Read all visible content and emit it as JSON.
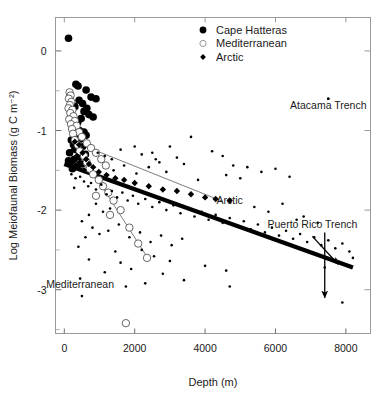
{
  "chart_data": {
    "type": "scatter",
    "title": "",
    "xlabel": "Depth (m)",
    "ylabel": "Log Meiofaunal Biomass (g C m⁻²)",
    "xlim": [
      -250,
      8700
    ],
    "ylim": [
      -3.55,
      0.42
    ],
    "xticks": [
      0,
      2000,
      4000,
      6000,
      8000
    ],
    "xtick_labels": [
      "0",
      "2000",
      "4000",
      "6000",
      "8000"
    ],
    "yticks": [
      0,
      -1,
      -2,
      -3
    ],
    "ytick_labels": [
      "0",
      "-1",
      "-2",
      "-3"
    ],
    "yminor_ticks": [
      -0.5,
      -1.5,
      -2.5,
      -3.5
    ],
    "grid": false,
    "legend_position": "top-center",
    "series": [
      {
        "name": "Cape Hatteras",
        "marker": "filled-circle",
        "marker_size": 5.2,
        "color": "#000000",
        "points": [
          [
            120,
            0.16
          ],
          [
            330,
            -0.42
          ],
          [
            390,
            -0.44
          ],
          [
            620,
            -0.49
          ],
          [
            760,
            -0.58
          ],
          [
            420,
            -0.62
          ],
          [
            520,
            -0.66
          ],
          [
            900,
            -0.6
          ],
          [
            300,
            -0.7
          ],
          [
            640,
            -0.72
          ],
          [
            560,
            -0.76
          ],
          [
            700,
            -0.8
          ],
          [
            480,
            -0.85
          ],
          [
            380,
            -0.9
          ],
          [
            820,
            -0.83
          ],
          [
            250,
            -0.95
          ],
          [
            430,
            -1.0
          ],
          [
            560,
            -1.02
          ],
          [
            330,
            -1.05
          ],
          [
            620,
            -1.06
          ],
          [
            300,
            -1.08
          ],
          [
            480,
            -1.1
          ],
          [
            200,
            -1.12
          ],
          [
            390,
            -1.14
          ],
          [
            260,
            -1.18
          ],
          [
            520,
            -1.2
          ],
          [
            340,
            -1.24
          ],
          [
            150,
            -1.28
          ],
          [
            600,
            -1.3
          ],
          [
            420,
            -1.33
          ],
          [
            280,
            -1.36
          ],
          [
            180,
            -1.4
          ],
          [
            500,
            -1.42
          ],
          [
            360,
            -1.45
          ],
          [
            230,
            -1.48
          ],
          [
            120,
            -1.38
          ]
        ]
      },
      {
        "name": "Mediterranean",
        "marker": "open-circle",
        "marker_size": 5.0,
        "color": "#555555",
        "points": [
          [
            150,
            -0.52
          ],
          [
            180,
            -0.56
          ],
          [
            130,
            -0.6
          ],
          [
            200,
            -0.64
          ],
          [
            160,
            -0.68
          ],
          [
            120,
            -0.72
          ],
          [
            230,
            -0.74
          ],
          [
            170,
            -0.78
          ],
          [
            260,
            -0.82
          ],
          [
            140,
            -0.86
          ],
          [
            300,
            -0.88
          ],
          [
            190,
            -0.92
          ],
          [
            350,
            -0.94
          ],
          [
            220,
            -0.98
          ],
          [
            420,
            -1.02
          ],
          [
            250,
            -1.04
          ],
          [
            500,
            -1.08
          ],
          [
            300,
            -1.12
          ],
          [
            640,
            -1.16
          ],
          [
            380,
            -1.18
          ],
          [
            760,
            -1.22
          ],
          [
            440,
            -1.26
          ],
          [
            900,
            -1.28
          ],
          [
            560,
            -1.32
          ],
          [
            1050,
            -1.36
          ],
          [
            640,
            -1.4
          ],
          [
            1180,
            -1.44
          ],
          [
            720,
            -1.48
          ],
          [
            820,
            -1.55
          ],
          [
            980,
            -1.62
          ],
          [
            1100,
            -1.7
          ],
          [
            1250,
            -1.78
          ],
          [
            900,
            -1.82
          ],
          [
            1400,
            -1.88
          ],
          [
            1600,
            -2.0
          ],
          [
            1300,
            -2.06
          ],
          [
            1850,
            -2.22
          ],
          [
            2100,
            -2.42
          ],
          [
            2350,
            -2.6
          ],
          [
            1750,
            -3.42
          ]
        ]
      },
      {
        "name": "Arctic",
        "marker": "filled-diamond",
        "marker_size": 3.6,
        "color": "#000000",
        "points": [
          [
            300,
            -1.14
          ],
          [
            420,
            -1.18
          ],
          [
            250,
            -1.24
          ],
          [
            520,
            -1.28
          ],
          [
            360,
            -1.32
          ],
          [
            620,
            -1.36
          ],
          [
            440,
            -1.4
          ],
          [
            700,
            -1.42
          ],
          [
            820,
            -1.46
          ],
          [
            560,
            -1.5
          ],
          [
            980,
            -1.52
          ],
          [
            1200,
            -1.56
          ],
          [
            1450,
            -1.6
          ],
          [
            1700,
            -1.62
          ],
          [
            2000,
            -1.66
          ],
          [
            2400,
            -1.7
          ],
          [
            2800,
            -1.74
          ],
          [
            3200,
            -1.76
          ],
          [
            3600,
            -1.8
          ],
          [
            4000,
            -1.84
          ],
          [
            4300,
            -1.86
          ],
          [
            4700,
            -1.88
          ]
        ]
      },
      {
        "name": "Other stations",
        "marker": "small-dot",
        "marker_size": 1.8,
        "color": "#000000",
        "points": [
          [
            200,
            -1.55
          ],
          [
            320,
            -1.6
          ],
          [
            450,
            -1.58
          ],
          [
            560,
            -1.64
          ],
          [
            680,
            -1.7
          ],
          [
            280,
            -1.72
          ],
          [
            760,
            -1.66
          ],
          [
            900,
            -1.74
          ],
          [
            1050,
            -1.68
          ],
          [
            1200,
            -1.8
          ],
          [
            1350,
            -1.76
          ],
          [
            1500,
            -1.84
          ],
          [
            1650,
            -1.78
          ],
          [
            1800,
            -1.88
          ],
          [
            1950,
            -1.82
          ],
          [
            2100,
            -1.92
          ],
          [
            2300,
            -1.86
          ],
          [
            2500,
            -1.96
          ],
          [
            2700,
            -1.9
          ],
          [
            2900,
            -2.0
          ],
          [
            3100,
            -1.94
          ],
          [
            3300,
            -2.04
          ],
          [
            3500,
            -1.98
          ],
          [
            3700,
            -2.08
          ],
          [
            3900,
            -2.02
          ],
          [
            4100,
            -2.12
          ],
          [
            4300,
            -2.06
          ],
          [
            4500,
            -2.16
          ],
          [
            4700,
            -2.1
          ],
          [
            4900,
            -2.2
          ],
          [
            5100,
            -2.14
          ],
          [
            5300,
            -2.24
          ],
          [
            5500,
            -2.18
          ],
          [
            5700,
            -2.28
          ],
          [
            5900,
            -2.22
          ],
          [
            6100,
            -2.32
          ],
          [
            6300,
            -2.26
          ],
          [
            6500,
            -2.36
          ],
          [
            6700,
            -2.3
          ],
          [
            6900,
            -2.4
          ],
          [
            7100,
            -2.34
          ],
          [
            7300,
            -2.44
          ],
          [
            7500,
            -2.38
          ],
          [
            7700,
            -2.48
          ],
          [
            7900,
            -2.42
          ],
          [
            8100,
            -2.52
          ],
          [
            3600,
            -1.08
          ],
          [
            4200,
            -1.26
          ],
          [
            4500,
            -1.32
          ],
          [
            3000,
            -1.2
          ],
          [
            2600,
            -1.36
          ],
          [
            2200,
            -1.3
          ],
          [
            5200,
            -1.46
          ],
          [
            4800,
            -1.44
          ],
          [
            5600,
            -1.52
          ],
          [
            6000,
            -1.48
          ],
          [
            3400,
            -1.42
          ],
          [
            2900,
            -1.52
          ],
          [
            4600,
            -1.56
          ],
          [
            5000,
            -1.6
          ],
          [
            3800,
            -1.62
          ],
          [
            6400,
            -1.58
          ],
          [
            1700,
            -1.44
          ],
          [
            1400,
            -1.5
          ],
          [
            2050,
            -1.54
          ],
          [
            2400,
            -1.46
          ],
          [
            900,
            -1.92
          ],
          [
            1100,
            -2.02
          ],
          [
            700,
            -2.06
          ],
          [
            1300,
            -1.98
          ],
          [
            500,
            -2.14
          ],
          [
            800,
            -2.22
          ],
          [
            1000,
            -2.3
          ],
          [
            600,
            -2.34
          ],
          [
            1250,
            -2.26
          ],
          [
            1550,
            -2.18
          ],
          [
            1850,
            -2.34
          ],
          [
            2150,
            -2.28
          ],
          [
            2450,
            -2.4
          ],
          [
            2750,
            -2.32
          ],
          [
            3050,
            -2.44
          ],
          [
            3350,
            -2.36
          ],
          [
            400,
            -2.46
          ],
          [
            1450,
            -2.52
          ],
          [
            2200,
            -2.5
          ],
          [
            700,
            -2.62
          ],
          [
            1600,
            -2.66
          ],
          [
            2550,
            -2.58
          ],
          [
            3000,
            -2.64
          ],
          [
            1900,
            -2.74
          ],
          [
            1150,
            -2.78
          ],
          [
            450,
            -2.86
          ],
          [
            2800,
            -2.8
          ],
          [
            2300,
            -2.92
          ],
          [
            1750,
            -2.96
          ],
          [
            3400,
            -2.88
          ],
          [
            4000,
            -2.7
          ],
          [
            4600,
            -2.76
          ],
          [
            500,
            -3.08
          ],
          [
            4700,
            -2.96
          ],
          [
            7400,
            -2.72
          ],
          [
            7900,
            -3.16
          ],
          [
            7500,
            -0.6
          ],
          [
            8200,
            -2.6
          ],
          [
            6800,
            -2.08
          ],
          [
            7200,
            -2.16
          ],
          [
            5400,
            -1.96
          ],
          [
            5800,
            -2.02
          ],
          [
            6200,
            -1.92
          ],
          [
            6600,
            -2.12
          ],
          [
            2000,
            -1.2
          ],
          [
            1600,
            -1.24
          ],
          [
            2500,
            -1.28
          ],
          [
            3200,
            -1.34
          ],
          [
            1350,
            -1.36
          ],
          [
            1150,
            -1.32
          ],
          [
            950,
            -1.28
          ],
          [
            2700,
            -1.4
          ]
        ]
      }
    ],
    "regression_lines": [
      {
        "name": "overall-trend",
        "style": "thick-black",
        "width": 4.2,
        "color": "#000000",
        "x0": 0,
        "y0": -1.42,
        "x1": 8200,
        "y1": -2.72
      },
      {
        "name": "arctic-trend",
        "style": "thin-gray",
        "width": 0.9,
        "color": "#6e6e6e",
        "x0": 150,
        "y0": -1.12,
        "x1": 4500,
        "y1": -1.89
      },
      {
        "name": "mediterranean-trend",
        "style": "thin-gray",
        "width": 0.9,
        "color": "#6e6e6e",
        "x0": 200,
        "y0": -1.1,
        "x1": 2400,
        "y1": -2.62
      },
      {
        "name": "mediterranean-upper-trend",
        "style": "thin-gray",
        "width": 0.9,
        "color": "#6e6e6e",
        "x0": 120,
        "y0": -0.55,
        "x1": 620,
        "y1": -1.52
      }
    ],
    "annotations": [
      {
        "name": "atacama-trench",
        "text": "Atacama Trench",
        "x": 7500,
        "y": -0.73,
        "marker_x": 7500,
        "marker_y": -0.6
      },
      {
        "name": "puerto-rico-trench",
        "text": "Puerto Rico Trench",
        "x": 7050,
        "y": -2.23,
        "arrow_from_x": 7050,
        "arrow_from_y": -2.33,
        "arrow_to_x": 7780,
        "arrow_to_y": -2.68
      },
      {
        "name": "hadal-arrow",
        "text": "",
        "arrow_from_x": 7400,
        "arrow_from_y": -2.28,
        "arrow_to_x": 7400,
        "arrow_to_y": -3.1
      },
      {
        "name": "arctic-label",
        "text": "Arctic",
        "x": 4700,
        "y": -1.92
      },
      {
        "name": "mediterranean-label",
        "text": "Mediterranean",
        "x": 450,
        "y": -2.98
      }
    ],
    "legend": [
      {
        "label": "Cape Hatteras",
        "marker": "filled-circle"
      },
      {
        "label": "Mediterranean",
        "marker": "open-circle"
      },
      {
        "label": "Arctic",
        "marker": "filled-diamond"
      }
    ]
  }
}
